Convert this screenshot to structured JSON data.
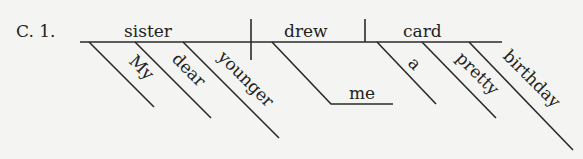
{
  "problem_label": "C. 1.",
  "sentence_diagram": {
    "subject": "sister",
    "verb": "drew",
    "direct_object": "card",
    "indirect_object": "me",
    "subject_modifiers": [
      "My",
      "dear",
      "younger"
    ],
    "object_modifiers": [
      "a",
      "pretty",
      "birthday"
    ]
  },
  "colors": {
    "background": "#f4f4f2",
    "ink": "#222222"
  }
}
